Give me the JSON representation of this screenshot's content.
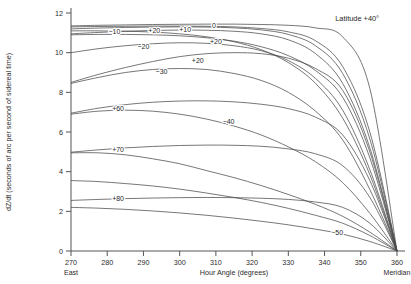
{
  "chart_data": {
    "type": "line",
    "title": "Latitude +40°",
    "xlabel": "Hour Angle (degrees)",
    "ylabel": "dZ/dt (seconds of arc per second of sidereal time)",
    "xlim": [
      270,
      360
    ],
    "ylim": [
      0,
      12
    ],
    "grid": false,
    "legend_position": "inline-curve-labels",
    "xticks": [
      270,
      280,
      290,
      300,
      310,
      320,
      330,
      340,
      350,
      360
    ],
    "xticklabels": [
      "270",
      "280",
      "290",
      "300",
      "310",
      "320",
      "330",
      "340",
      "350",
      "360"
    ],
    "yticks": [
      0,
      2,
      4,
      6,
      8,
      10,
      12
    ],
    "yticklabels": [
      "0",
      "2",
      "4",
      "6",
      "8",
      "10",
      "12"
    ],
    "x_axis_end_labels": {
      "left": "East",
      "right": "Meridian"
    },
    "x": [
      270,
      277.5,
      285,
      292.5,
      300,
      307.5,
      315,
      322.5,
      330,
      337.5,
      345,
      352.5,
      360
    ],
    "series": [
      {
        "name": "+40",
        "label": "Latitude +40°",
        "label_x": 349,
        "label_y": 11.72,
        "values": [
          11.35,
          11.38,
          11.4,
          11.42,
          11.43,
          11.44,
          11.44,
          11.42,
          11.38,
          11.25,
          10.8,
          8.2,
          0
        ]
      },
      {
        "name": "0",
        "label": "0",
        "label_x": 309.5,
        "label_y": 11.35,
        "values": [
          11.3,
          11.32,
          11.33,
          11.34,
          11.34,
          11.33,
          11.3,
          11.22,
          11.05,
          10.6,
          9.3,
          6.0,
          0
        ]
      },
      {
        "name": "+10",
        "label": "+10",
        "label_x": 301.5,
        "label_y": 11.15,
        "values": [
          11.2,
          11.24,
          11.27,
          11.29,
          11.3,
          11.29,
          11.25,
          11.15,
          10.92,
          10.35,
          8.95,
          5.65,
          0
        ]
      },
      {
        "name": "+20",
        "label": "+20",
        "label_x": 293.0,
        "label_y": 11.1,
        "values": [
          10.95,
          11.02,
          11.08,
          11.12,
          11.14,
          11.13,
          11.08,
          10.95,
          10.65,
          9.95,
          8.45,
          5.2,
          0
        ]
      },
      {
        "name": "-10",
        "label": "−10",
        "label_x": 282.0,
        "label_y": 11.05,
        "values": [
          11.1,
          11.1,
          11.08,
          11.04,
          10.95,
          10.8,
          10.55,
          10.15,
          9.5,
          8.45,
          6.7,
          3.85,
          0
        ]
      },
      {
        "name": "+20b",
        "label": "+20",
        "label_x": 310.0,
        "label_y": 10.55,
        "values": [
          10.9,
          10.92,
          10.92,
          10.9,
          10.85,
          10.75,
          10.58,
          10.3,
          9.85,
          9.1,
          7.75,
          4.7,
          0
        ]
      },
      {
        "name": "-20",
        "label": "−20",
        "label_x": 290.0,
        "label_y": 10.3,
        "values": [
          10.0,
          10.2,
          10.35,
          10.45,
          10.5,
          10.47,
          10.35,
          10.1,
          9.6,
          8.7,
          7.1,
          4.1,
          0
        ]
      },
      {
        "name": "+20c",
        "label": "+20",
        "label_x": 305.0,
        "label_y": 9.62,
        "values": [
          8.5,
          8.9,
          9.25,
          9.55,
          9.8,
          9.95,
          10.0,
          9.95,
          9.72,
          9.2,
          8.1,
          5.0,
          0
        ]
      },
      {
        "name": "-30",
        "label": "−30",
        "label_x": 295.0,
        "label_y": 9.05,
        "values": [
          8.45,
          8.75,
          9.0,
          9.15,
          9.2,
          9.15,
          8.95,
          8.6,
          8.0,
          7.05,
          5.6,
          3.1,
          0
        ]
      },
      {
        "name": "+60",
        "label": "+60",
        "label_x": 283.0,
        "label_y": 7.2,
        "values": [
          6.95,
          7.2,
          7.38,
          7.5,
          7.56,
          7.57,
          7.52,
          7.4,
          7.18,
          6.75,
          5.85,
          3.55,
          0
        ]
      },
      {
        "name": "-40",
        "label": "−40",
        "label_x": 313.5,
        "label_y": 6.5,
        "values": [
          6.9,
          7.05,
          7.1,
          7.05,
          6.9,
          6.65,
          6.3,
          5.85,
          5.25,
          4.5,
          3.45,
          1.9,
          0
        ]
      },
      {
        "name": "+70",
        "label": "+70",
        "label_x": 283.0,
        "label_y": 5.12,
        "values": [
          4.98,
          5.1,
          5.2,
          5.27,
          5.32,
          5.34,
          5.33,
          5.28,
          5.15,
          4.9,
          4.3,
          2.7,
          0
        ]
      },
      {
        "name": "-50",
        "label": "−50",
        "label_x": 343.5,
        "label_y": 0.95,
        "values": [
          4.95,
          4.95,
          4.85,
          4.65,
          4.4,
          4.05,
          3.7,
          3.3,
          2.85,
          2.35,
          1.75,
          0.95,
          0
        ]
      },
      {
        "name": "+80",
        "label": "+80",
        "label_x": 283.0,
        "label_y": 2.62,
        "values": [
          2.55,
          2.6,
          2.64,
          2.67,
          2.69,
          2.7,
          2.69,
          2.66,
          2.6,
          2.47,
          2.2,
          1.4,
          0
        ]
      },
      {
        "name": "conv1",
        "label": "",
        "label_x": null,
        "label_y": null,
        "values": [
          3.55,
          3.5,
          3.4,
          3.28,
          3.12,
          2.92,
          2.7,
          2.45,
          2.15,
          1.8,
          1.4,
          0.78,
          0
        ]
      },
      {
        "name": "conv2",
        "label": "",
        "label_x": null,
        "label_y": null,
        "values": [
          2.2,
          2.16,
          2.1,
          2.02,
          1.92,
          1.8,
          1.66,
          1.5,
          1.32,
          1.1,
          0.85,
          0.48,
          0
        ]
      }
    ],
    "colors": {
      "axis": "#555555",
      "curve": "#4a4a4a",
      "text": "#2b2b2b",
      "background": "#ffffff"
    }
  }
}
